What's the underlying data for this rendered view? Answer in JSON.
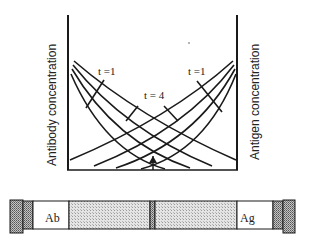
{
  "diagram": {
    "left_axis_label": "Antibody concentration",
    "right_axis_label": "Antigen concentration",
    "curve_labels": {
      "left_t1": "t =1",
      "center_t4": "t = 4",
      "right_t1": "t =1"
    },
    "curves": {
      "antibody_family_count": 4,
      "antigen_family_count": 4,
      "times": [
        1,
        2,
        3,
        4
      ]
    },
    "tube": {
      "left_well_label": "Ab",
      "right_well_label": "Ag",
      "segments": [
        "end-cap",
        "Ab well",
        "gel",
        "divider",
        "gel",
        "Ag well",
        "end-cap"
      ]
    },
    "colors": {
      "line": "#1a1a1a",
      "gel_fill": "#d9d9d9",
      "cap_fill": "#a8a8a8",
      "background": "#ffffff"
    }
  }
}
